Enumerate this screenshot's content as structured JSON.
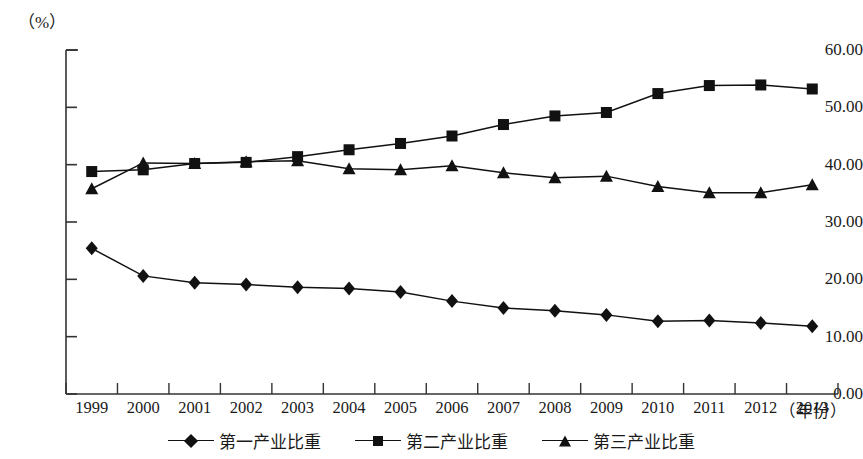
{
  "chart_data": {
    "type": "line",
    "title": "",
    "subtitle": "",
    "xlabel": "（年份）",
    "ylabel": "（%）",
    "x": [
      "1999",
      "2000",
      "2001",
      "2002",
      "2003",
      "2004",
      "2005",
      "2006",
      "2007",
      "2008",
      "2009",
      "2010",
      "2011",
      "2012",
      "2013"
    ],
    "categories": [
      "1999",
      "2000",
      "2001",
      "2002",
      "2003",
      "2004",
      "2005",
      "2006",
      "2007",
      "2008",
      "2009",
      "2010",
      "2011",
      "2012",
      "2013"
    ],
    "ylim": [
      0,
      60
    ],
    "xlim": [
      "1999",
      "2013"
    ],
    "yticks": [
      "0.00",
      "10.00",
      "20.00",
      "30.00",
      "40.00",
      "50.00",
      "60.00"
    ],
    "ytick_values": [
      0,
      10,
      20,
      30,
      40,
      50,
      60
    ],
    "grid": false,
    "legend_position": "bottom",
    "series": [
      {
        "name": "第一产业比重",
        "marker": "diamond",
        "color": "#111111",
        "values": [
          25.4,
          20.6,
          19.4,
          19.1,
          18.6,
          18.4,
          17.8,
          16.2,
          15.0,
          14.5,
          13.8,
          12.7,
          12.8,
          12.4,
          11.8
        ]
      },
      {
        "name": "第二产业比重",
        "marker": "square",
        "color": "#111111",
        "values": [
          38.8,
          39.1,
          40.2,
          40.4,
          41.4,
          42.6,
          43.7,
          45.0,
          47.0,
          48.5,
          49.1,
          52.4,
          53.8,
          53.9,
          53.2
        ]
      },
      {
        "name": "第三产业比重",
        "marker": "triangle",
        "color": "#111111",
        "values": [
          35.8,
          40.3,
          40.2,
          40.5,
          40.7,
          39.3,
          39.1,
          39.8,
          38.6,
          37.7,
          38.0,
          36.2,
          35.1,
          35.1,
          36.5
        ]
      }
    ]
  },
  "axis": {
    "unit_label": "（%）",
    "x_axis_title": "（年份）"
  },
  "legend": {
    "items": [
      {
        "label": "第一产业比重",
        "marker": "diamond-marker"
      },
      {
        "label": "第二产业比重",
        "marker": "square-marker"
      },
      {
        "label": "第三产业比重",
        "marker": "triangle-marker"
      }
    ]
  }
}
